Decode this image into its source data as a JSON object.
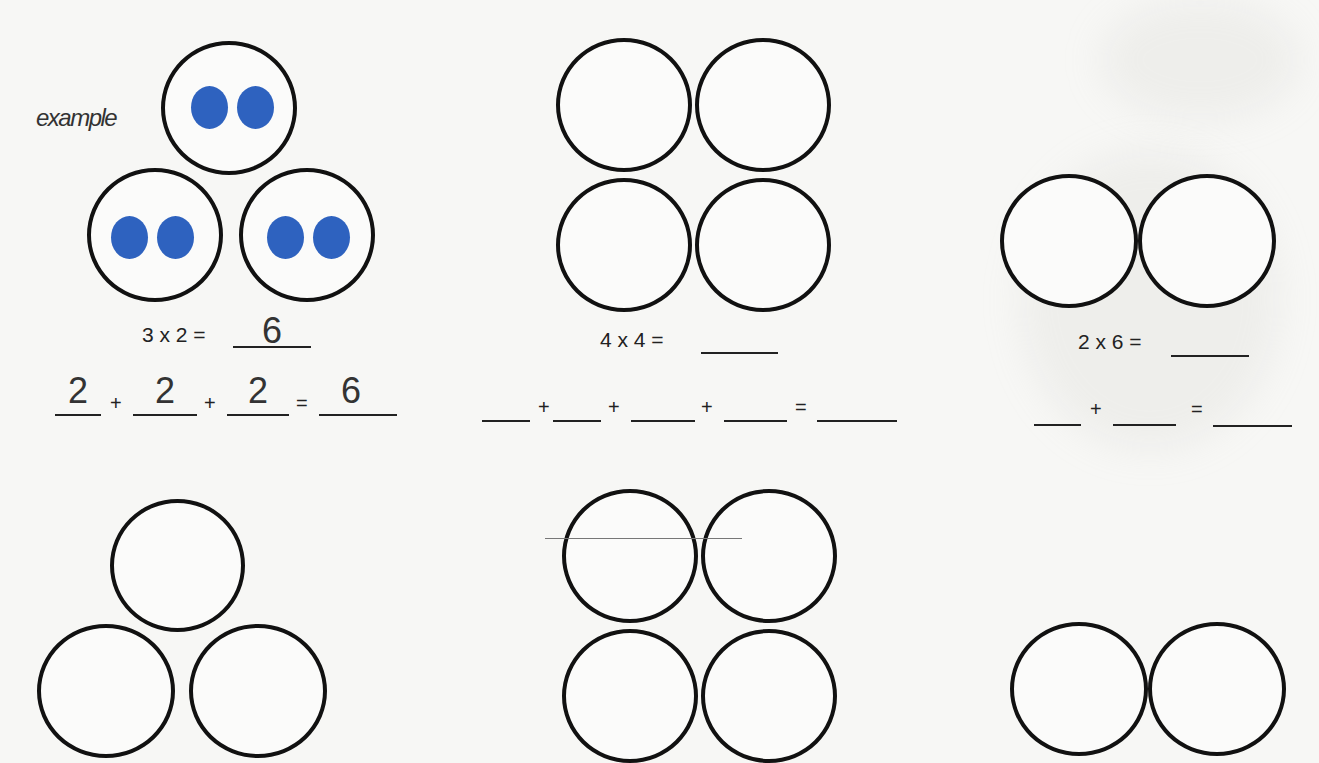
{
  "worksheet": {
    "example_label": "example",
    "problems": [
      {
        "id": "example",
        "groups": 3,
        "per_group": 2,
        "layout": "triangle",
        "dots_filled": true,
        "multiplication": {
          "expression": "3 x 2 =",
          "answer": "6"
        },
        "addition": {
          "addends": [
            "2",
            "2",
            "2"
          ],
          "plus": "+",
          "equals": "=",
          "answer": "6"
        }
      },
      {
        "id": "problem-1",
        "groups": 4,
        "layout": "2x2",
        "multiplication": {
          "expression": "4 x 4  =",
          "answer": ""
        },
        "addition": {
          "addends": [
            "",
            "",
            "",
            ""
          ],
          "plus": "+",
          "equals": "=",
          "answer": ""
        }
      },
      {
        "id": "problem-2",
        "groups": 2,
        "layout": "row",
        "multiplication": {
          "expression": "2 x 6 =",
          "answer": ""
        },
        "addition": {
          "addends": [
            "",
            ""
          ],
          "plus": "+",
          "equals": "=",
          "answer": ""
        }
      },
      {
        "id": "problem-3",
        "groups": 3,
        "layout": "triangle"
      },
      {
        "id": "problem-4",
        "groups": 4,
        "layout": "2x2"
      },
      {
        "id": "problem-5",
        "groups": 2,
        "layout": "row"
      }
    ]
  },
  "colors": {
    "dot": "#2e62bf",
    "circle_stroke": "#111111",
    "paper": "#f7f7f5"
  }
}
